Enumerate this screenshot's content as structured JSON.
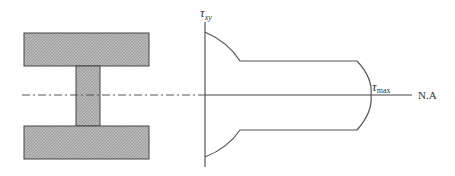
{
  "diagram": {
    "cross_section": {
      "shape": "I-beam",
      "fill_color": "#b4b4b4",
      "stroke_color": "#444444",
      "top_flange": {
        "x": 24,
        "y": 33,
        "w": 125,
        "h": 33
      },
      "web": {
        "x": 76,
        "y": 66,
        "w": 24,
        "h": 60
      },
      "bottom_flange": {
        "x": 24,
        "y": 126,
        "w": 125,
        "h": 33
      }
    },
    "neutral_axis": {
      "label": "N.A",
      "style": "dash-dot (on section), solid (on diagram)",
      "y": 95
    },
    "axis_label": {
      "symbol": "τ",
      "subscript": "xy"
    },
    "max_label": {
      "symbol": "τ",
      "subscript": "max"
    },
    "annotation": "Shear stress τxy varies parabolically across flanges, jumps at flange-web junction, and reaches τmax at the neutral axis"
  }
}
